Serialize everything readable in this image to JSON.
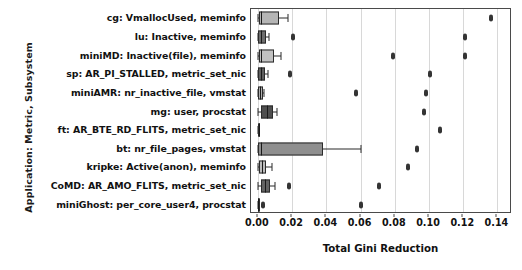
{
  "chart_data": {
    "type": "box",
    "title": "",
    "xlabel": "Total Gini Reduction",
    "ylabel": "Application: Metric, Subsystem",
    "xlim": [
      -0.004,
      0.1485
    ],
    "xticks": [
      0.0,
      0.02,
      0.04,
      0.06,
      0.08,
      0.1,
      0.12,
      0.14
    ],
    "xticklabels": [
      "0.00",
      "0.02",
      "0.04",
      "0.06",
      "0.08",
      "0.10",
      "0.12",
      "0.14"
    ],
    "grid": "vertical",
    "legend": "none",
    "orientation": "horizontal",
    "categories": [
      "cg: VmallocUsed, meminfo",
      "lu: Inactive, meminfo",
      "miniMD: Inactive(file), meminfo",
      "sp: AR_PI_STALLED, metric_set_nic",
      "miniAMR: nr_inactive_file, vmstat",
      "mg: user, procstat",
      "ft: AR_BTE_RD_FLITS, metric_set_nic",
      "bt: nr_file_pages, vmstat",
      "kripke: Active(anon), meminfo",
      "CoMD: AR_AMO_FLITS, metric_set_nic",
      "miniGhost: per_core_user4, procstat"
    ],
    "boxes": [
      {
        "label": "cg: VmallocUsed, meminfo",
        "whislo": 0.0,
        "q1": 0.0009,
        "med": 0.0016,
        "q3": 0.0122,
        "whishi": 0.0175,
        "fliers": [
          0.1365
        ],
        "fill": "#b5b5b5"
      },
      {
        "label": "lu: Inactive, meminfo",
        "whislo": 0.0,
        "q1": 0.0002,
        "med": 0.0021,
        "q3": 0.0045,
        "whishi": 0.0066,
        "fliers": [
          0.0207,
          0.1212
        ],
        "fill": "#6e6e6e"
      },
      {
        "label": "miniMD: Inactive(file), meminfo",
        "whislo": 0.0,
        "q1": 0.0007,
        "med": 0.0021,
        "q3": 0.0094,
        "whishi": 0.0136,
        "fliers": [
          0.079,
          0.1211
        ],
        "fill": "#c2c2c2"
      },
      {
        "label": "sp: AR_PI_STALLED, metric_set_nic",
        "whislo": 0.0,
        "q1": 0.0003,
        "med": 0.0017,
        "q3": 0.0042,
        "whishi": 0.0061,
        "fliers": [
          0.019,
          0.1004
        ],
        "fill": "#5f5f5f"
      },
      {
        "label": "miniAMR: nr_inactive_file, vmstat",
        "whislo": 0.0,
        "q1": 0.0003,
        "med": 0.0013,
        "q3": 0.0028,
        "whishi": 0.0038,
        "fliers": [
          0.0573,
          0.0985
        ],
        "fill": "#b0b0b0"
      },
      {
        "label": "mg: user, procstat",
        "whislo": 0.0,
        "q1": 0.0016,
        "med": 0.0051,
        "q3": 0.0087,
        "whishi": 0.0113,
        "fliers": [
          0.097
        ],
        "fill": "#4f4f4f"
      },
      {
        "label": "ft: AR_BTE_RD_FLITS, metric_set_nic",
        "whislo": 0.0,
        "q1": 0.0002,
        "med": 0.0004,
        "q3": 0.0007,
        "whishi": 0.0009,
        "fliers": [
          0.1062
        ],
        "fill": "#5a5a5a"
      },
      {
        "label": "bt: nr_file_pages, vmstat",
        "whislo": 0.0,
        "q1": 0.0002,
        "med": 0.0021,
        "q3": 0.0383,
        "whishi": 0.06,
        "fliers": [
          0.093
        ],
        "fill": "#8f8f8f"
      },
      {
        "label": "kripke: Active(anon), meminfo",
        "whislo": 0.0,
        "q1": 0.0005,
        "med": 0.0026,
        "q3": 0.005,
        "whishi": 0.008,
        "fliers": [
          0.088
        ],
        "fill": "#bcbcbc"
      },
      {
        "label": "CoMD: AR_AMO_FLITS, metric_set_nic",
        "whislo": 0.0,
        "q1": 0.0018,
        "med": 0.0039,
        "q3": 0.0071,
        "whishi": 0.0098,
        "fliers": [
          0.0182,
          0.071
        ],
        "fill": "#636363"
      },
      {
        "label": "miniGhost: per_core_user4, procstat",
        "whislo": 0.0,
        "q1": 0.0001,
        "med": 0.0003,
        "q3": 0.0005,
        "whishi": 0.0007,
        "fliers": [
          0.003,
          0.0603
        ],
        "fill": "#6a6a6a"
      }
    ]
  }
}
